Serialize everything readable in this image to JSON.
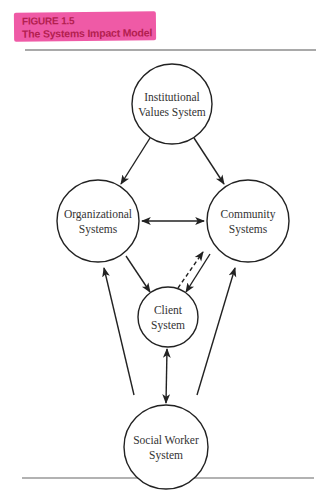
{
  "figure": {
    "number_label": "FIGURE 1.5",
    "title": "The Systems Impact Model",
    "highlight_color": "#ef5aa6",
    "label_text_color": "#b3204f"
  },
  "nodes": {
    "institutional": {
      "line1": "Institutional",
      "line2": "Values System"
    },
    "organizational": {
      "line1": "Organizational",
      "line2": "Systems"
    },
    "community": {
      "line1": "Community",
      "line2": "Systems"
    },
    "client": {
      "line1": "Client",
      "line2": "System"
    },
    "social_worker": {
      "line1": "Social Worker",
      "line2": "System"
    }
  },
  "edges": [
    {
      "from": "Institutional Values System",
      "to": "Organizational Systems",
      "style": "solid",
      "direction": "one-way"
    },
    {
      "from": "Institutional Values System",
      "to": "Community Systems",
      "style": "solid",
      "direction": "one-way"
    },
    {
      "from": "Organizational Systems",
      "to": "Community Systems",
      "style": "solid",
      "direction": "two-way"
    },
    {
      "from": "Organizational Systems",
      "to": "Client System",
      "style": "solid",
      "direction": "one-way"
    },
    {
      "from": "Community Systems",
      "to": "Client System",
      "style": "solid",
      "direction": "one-way"
    },
    {
      "from": "Client System",
      "to": "Community Systems",
      "style": "dashed",
      "direction": "one-way"
    },
    {
      "from": "Client System",
      "to": "Social Worker System",
      "style": "solid",
      "direction": "two-way"
    },
    {
      "from": "Social Worker System",
      "to": "Organizational Systems",
      "style": "solid",
      "direction": "one-way"
    },
    {
      "from": "Social Worker System",
      "to": "Community Systems",
      "style": "solid",
      "direction": "one-way"
    }
  ]
}
